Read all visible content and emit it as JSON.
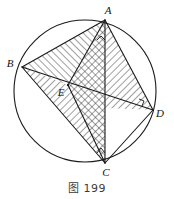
{
  "figure": {
    "caption": "图 199",
    "caption_number": "199",
    "stroke_color": "#1a1a1a",
    "hatch_color": "#2b2b2b",
    "background": "#ffffff",
    "circle": {
      "cx": 85,
      "cy": 91,
      "r": 71,
      "label": "circumscribed-circle"
    },
    "points": [
      {
        "id": "A",
        "label": "A",
        "x": 105,
        "y": 20,
        "label_x": 108,
        "label_y": 14
      },
      {
        "id": "B",
        "label": "B",
        "x": 22,
        "y": 67,
        "label_x": 10,
        "label_y": 66
      },
      {
        "id": "C",
        "label": "C",
        "x": 105,
        "y": 163,
        "label_x": 106,
        "label_y": 176
      },
      {
        "id": "D",
        "label": "D",
        "x": 153,
        "y": 110,
        "label_x": 157,
        "label_y": 116
      },
      {
        "id": "E",
        "label": "E",
        "x": 68,
        "y": 85,
        "label_x": 60,
        "label_y": 95
      }
    ],
    "segments": [
      {
        "name": "chord-AB",
        "from": "A",
        "to": "B"
      },
      {
        "name": "chord-AD",
        "from": "A",
        "to": "D"
      },
      {
        "name": "chord-AC",
        "from": "A",
        "to": "C"
      },
      {
        "name": "chord-BC",
        "from": "B",
        "to": "C"
      },
      {
        "name": "chord-BD",
        "from": "B",
        "to": "D"
      },
      {
        "name": "chord-CD",
        "from": "C",
        "to": "D"
      },
      {
        "name": "segment-EA",
        "from": "E",
        "to": "A"
      },
      {
        "name": "segment-EC",
        "from": "E",
        "to": "C"
      }
    ],
    "hatched_regions": [
      {
        "name": "triangle-ABE",
        "vertices": "A,B,E",
        "pattern": "diagonal"
      },
      {
        "name": "triangle-AEC-cross",
        "vertices": "A,E,C",
        "pattern": "crosshatch"
      },
      {
        "name": "triangle-AED-right",
        "vertices": "A,E,D",
        "pattern": "diagonal"
      },
      {
        "name": "triangle-BEC",
        "vertices": "B,E,C",
        "pattern": "diagonal"
      }
    ],
    "right_angle_marks": [
      {
        "name": "right-angle-at-C",
        "x": 105,
        "y": 163
      },
      {
        "name": "right-angle-near-D",
        "x": 144,
        "y": 104
      },
      {
        "name": "right-angle-near-A",
        "x": 100,
        "y": 38
      }
    ]
  }
}
